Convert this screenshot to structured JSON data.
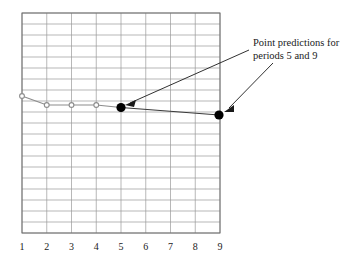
{
  "figure": {
    "background_color": "#ffffff",
    "annotation": {
      "name": "point-predictions-callout",
      "line1": "Point predictions for",
      "line2": "periods 5 and 9",
      "text_color": "#1a1a1a",
      "x": 253,
      "y": 46
    }
  },
  "chart_data": {
    "type": "line",
    "title": "",
    "xlabel": "",
    "ylabel": "",
    "grid": true,
    "legend_position": "none",
    "x": [
      1,
      2,
      3,
      4,
      5,
      6,
      7,
      8,
      9
    ],
    "xtick_labels": [
      "1",
      "2",
      "3",
      "4",
      "5",
      "6",
      "7",
      "8",
      "9"
    ],
    "xlim": [
      1,
      9
    ],
    "ylim": [
      0,
      20
    ],
    "yticks_count": 20,
    "xticks_count": 9,
    "ytick_labels": [],
    "series": [
      {
        "name": "observed",
        "marker": "open-circle",
        "color": "#8c8c8c",
        "x": [
          1,
          2,
          3,
          4
        ],
        "values": [
          12.5,
          11.6,
          11.6,
          11.6
        ]
      },
      {
        "name": "point-predictions",
        "marker": "filled-circle",
        "color": "#000000",
        "x": [
          5,
          9
        ],
        "values": [
          11.5,
          10.7
        ],
        "annotation": "Point predictions for periods 5 and 9"
      }
    ],
    "grid_color": "#9a9a9a",
    "border_color": "#6e6e6e"
  },
  "geometry": {
    "plot_left": 22,
    "plot_right": 220,
    "plot_top": 13,
    "plot_bottom": 233,
    "columns": 8,
    "rows": 20,
    "points": {
      "p1": {
        "x": 22,
        "y": 96
      },
      "p2": {
        "x": 46.75,
        "y": 105
      },
      "p3": {
        "x": 71.5,
        "y": 105
      },
      "p4": {
        "x": 96.25,
        "y": 105
      },
      "pred5": {
        "x": 121,
        "y": 107.5
      },
      "pred9": {
        "x": 219,
        "y": 115
      }
    },
    "axis_label_y": 250
  }
}
